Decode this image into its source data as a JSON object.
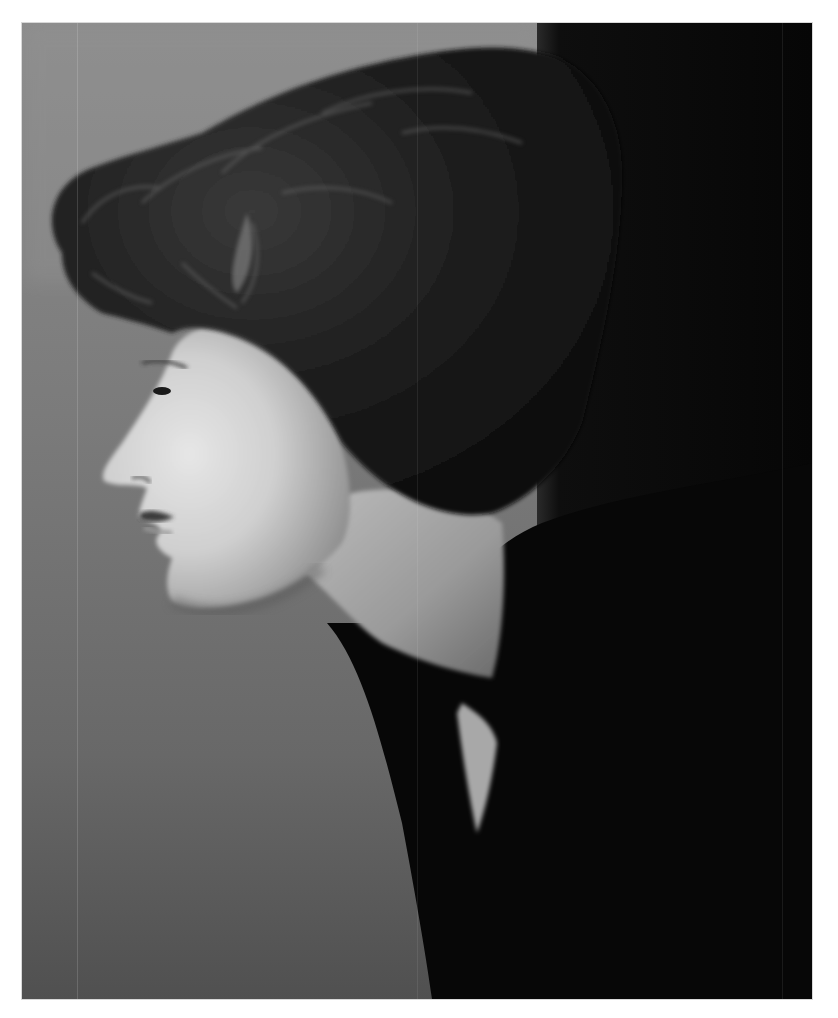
{
  "image": {
    "type": "photograph",
    "style": "black-and-white vintage studio portrait",
    "subject": "woman in left-facing profile with short dark curly hair, dark coat, pale skin",
    "colors": {
      "page_background": "#ffffff",
      "backdrop_light": "#8a8a8a",
      "backdrop_dark": "#4e4e4e",
      "right_panel": "#0a0a0a",
      "hair": "#1a1a1a",
      "skin_highlight": "#e2e2e2",
      "skin_shadow": "#8c8c8c",
      "coat": "#080808"
    }
  }
}
